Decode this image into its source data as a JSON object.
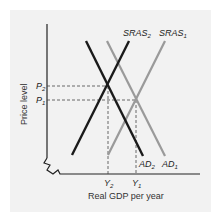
{
  "diagram": {
    "type": "AD-AS model",
    "x_axis_label": "Real GDP per year",
    "y_axis_label": "Price level",
    "curves": [
      {
        "id": "SRAS2",
        "label": "SRAS",
        "sub": "2",
        "color": "#1a1a1a"
      },
      {
        "id": "SRAS1",
        "label": "SRAS",
        "sub": "1",
        "color": "#9a9a9a"
      },
      {
        "id": "AD2",
        "label": "AD",
        "sub": "2",
        "color": "#1a1a1a"
      },
      {
        "id": "AD1",
        "label": "AD",
        "sub": "1",
        "color": "#9a9a9a"
      }
    ],
    "price_levels": [
      {
        "label": "P",
        "sub": "2"
      },
      {
        "label": "P",
        "sub": "1"
      }
    ],
    "output_levels": [
      {
        "label": "Y",
        "sub": "2"
      },
      {
        "label": "Y",
        "sub": "1"
      }
    ]
  }
}
